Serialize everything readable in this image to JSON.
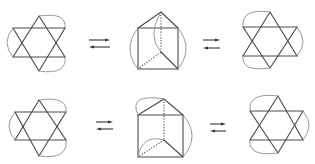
{
  "figure": {
    "colors": {
      "edge": "#4a4a4a",
      "arc": "#9a9a9a",
      "arrow": "#333333",
      "background": "#ffffff"
    },
    "rows": [
      {
        "id": "row-top",
        "left_net": {
          "top": [
            39,
            16
          ],
          "bottom": [
            39,
            71
          ],
          "upper_y": 28,
          "lower_y": 57,
          "x_left": 13,
          "x_right": 65
        },
        "arrows_1": {
          "x1": 89,
          "x2": 110,
          "y_right": 40,
          "y_left": 47
        },
        "prism": {
          "apex": [
            161,
            12
          ],
          "tl": [
            138,
            28
          ],
          "tr": [
            178,
            28
          ],
          "bl": [
            138,
            69
          ],
          "br": [
            178,
            69
          ],
          "center": [
            161,
            52
          ]
        },
        "arrows_2": {
          "x1": 203,
          "x2": 220,
          "y_right": 40,
          "y_left": 48
        },
        "right_net": {
          "top": [
            270,
            12
          ],
          "bottom": [
            270,
            68
          ],
          "upper_y": 27,
          "lower_y": 56,
          "x_left": 243,
          "x_right": 297
        }
      },
      {
        "id": "row-bottom",
        "left_net": {
          "top": [
            39,
            100
          ],
          "bottom": [
            39,
            156
          ],
          "upper_y": 112,
          "lower_y": 140,
          "x_left": 15,
          "x_right": 66
        },
        "arrows_1": {
          "x1": 96,
          "x2": 113,
          "y_right": 122,
          "y_left": 129
        },
        "prism": {
          "apex": [
            164,
            99
          ],
          "tl": [
            138,
            115
          ],
          "tr": [
            183,
            115
          ],
          "bl": [
            138,
            157
          ],
          "br": [
            183,
            157
          ],
          "center": [
            164,
            140
          ]
        },
        "arrows_2": {
          "x1": 210,
          "x2": 226,
          "y_right": 124,
          "y_left": 131
        },
        "right_net": {
          "top": [
            278,
            96
          ],
          "bottom": [
            278,
            153
          ],
          "upper_y": 111,
          "lower_y": 140,
          "x_left": 250,
          "x_right": 303
        }
      }
    ]
  }
}
